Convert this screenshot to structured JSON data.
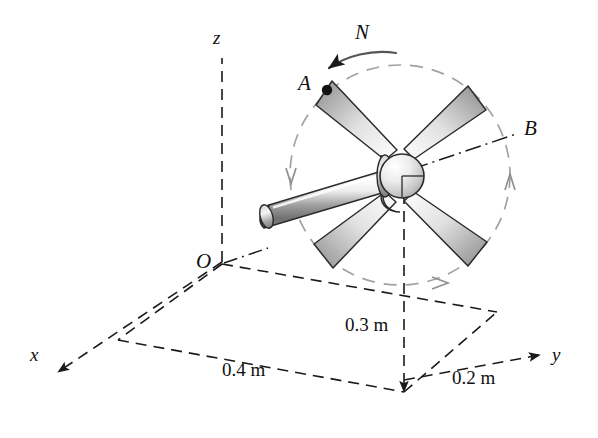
{
  "figure": {
    "background_color": "#ffffff",
    "line_color": "#1a1a1a",
    "guide_color": "#9a9a9a",
    "blade_fill_light": "#fbfbfb",
    "blade_fill_dark": "#8e8e8e",
    "shaft_fill_light": "#fdfdfd",
    "shaft_fill_dark": "#7d7d7d",
    "hub_fill_light": "#fafafa",
    "hub_fill_dark": "#9c9c9c"
  },
  "axes": {
    "x_label": "x",
    "y_label": "y",
    "z_label": "z",
    "origin_label": "O"
  },
  "points": {
    "a_label": "A",
    "b_label": "B"
  },
  "rotation": {
    "label": "N",
    "direction": "counterclockwise"
  },
  "dimensions": [
    {
      "id": "height",
      "label": "0.3 m"
    },
    {
      "id": "x_depth",
      "label": "0.4 m"
    },
    {
      "id": "y_depth",
      "label": "0.2 m"
    }
  ],
  "geometry": {
    "hub_center": {
      "x": 400,
      "y": 175
    },
    "hub_radius": 22,
    "circle_radius": 110,
    "blade_count": 4,
    "blade_angles_deg": [
      135,
      45,
      225,
      315
    ]
  }
}
